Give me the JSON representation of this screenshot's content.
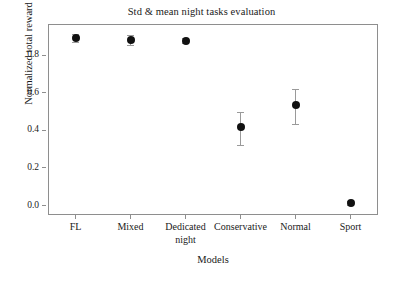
{
  "chart_data": {
    "type": "scatter",
    "title": "Std & mean night tasks evaluation",
    "xlabel": "Models",
    "ylabel": "Normalized total reward",
    "categories": [
      "FL",
      "Mixed",
      "Dedicated\nnight",
      "Conservative",
      "Normal",
      "Sport"
    ],
    "values": [
      0.89,
      0.88,
      0.875,
      0.42,
      0.535,
      0.015
    ],
    "errors_low": [
      0.022,
      0.028,
      0.013,
      0.1,
      0.1,
      0.012
    ],
    "errors_high": [
      0.022,
      0.028,
      0.013,
      0.08,
      0.085,
      0.012
    ],
    "ylim": [
      -0.05,
      0.965
    ],
    "yticks": [
      0.0,
      0.2,
      0.4,
      0.6,
      0.8
    ],
    "ytick_labels": [
      "0.0",
      "0.2",
      "0.4",
      "0.6",
      "0.8"
    ],
    "grid": false,
    "legend": "none",
    "marker_color": "#111111",
    "errorbar_color": "#9a9a9a",
    "frame_color": "#8e8e8e"
  }
}
